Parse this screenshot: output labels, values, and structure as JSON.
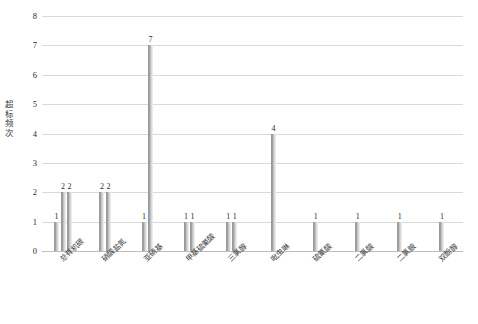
{
  "chart_data": {
    "type": "bar",
    "title": "",
    "xlabel": "",
    "ylabel": "超标频次",
    "ylim": [
      0,
      8
    ],
    "ytick_labels": [
      "0",
      "1",
      "2",
      "3",
      "4",
      "5",
      "6",
      "7",
      "8"
    ],
    "grid": true,
    "legend": "none",
    "categories": [
      "总有机碳",
      "硝酸盐氮",
      "亚硝基",
      "甲基硫氰酸",
      "三氯醇",
      "吡虫啉",
      "硫氰酸",
      "二氯酸",
      "二氯胺",
      "双酚醇"
    ],
    "groups": [
      {
        "category": "总有机碳",
        "values": [
          1,
          2,
          2
        ]
      },
      {
        "category": "硝酸盐氮",
        "values": [
          2,
          2
        ]
      },
      {
        "category": "亚硝基",
        "values": [
          1,
          7
        ]
      },
      {
        "category": "甲基硫氰酸",
        "values": [
          1,
          1
        ]
      },
      {
        "category": "三氯醇",
        "values": [
          1,
          1
        ]
      },
      {
        "category": "吡虫啉",
        "values": [
          4
        ]
      },
      {
        "category": "硫氰酸",
        "values": [
          1
        ]
      },
      {
        "category": "二氯酸",
        "values": [
          1
        ]
      },
      {
        "category": "二氯胺",
        "values": [
          1
        ]
      },
      {
        "category": "双酚醇",
        "values": [
          1
        ]
      }
    ],
    "values_flat": [
      1,
      2,
      2,
      2,
      2,
      1,
      7,
      1,
      1,
      1,
      1,
      4,
      1,
      1,
      1,
      1
    ],
    "colors": {
      "bar": "#a8a8a8",
      "gridline": "#d9d9d9",
      "axis": "#bdbdbd",
      "text": "#2b2b2b",
      "background": "#ffffff"
    }
  }
}
